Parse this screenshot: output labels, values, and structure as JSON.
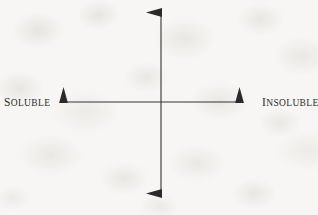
{
  "canvas": {
    "width": 318,
    "height": 215,
    "background_color": "#f7f6f4",
    "texture": "mottled-paper"
  },
  "diagram": {
    "type": "two-axis-cross",
    "line_color": "#333333",
    "line_width": 1.1,
    "center": {
      "x": 161,
      "y": 102
    },
    "axes": [
      {
        "id": "vertical-axis",
        "orientation": "vertical",
        "double_headed": true,
        "from": {
          "x": 161,
          "y": 194
        },
        "to": {
          "x": 161,
          "y": 12
        },
        "label_start": "",
        "label_end": ""
      },
      {
        "id": "horizontal-axis",
        "orientation": "horizontal",
        "double_headed": true,
        "from": {
          "x": 63,
          "y": 102
        },
        "to": {
          "x": 240,
          "y": 102
        },
        "label_start": "SOLUBLE",
        "label_end": "INSOLUBLE"
      }
    ],
    "arrowhead": {
      "length": 15,
      "half_width": 4.5,
      "color": "#2a2a2a"
    }
  },
  "labels": {
    "left": {
      "text": "SOLUBLE",
      "first_letter": "S",
      "rest": "OLUBLE",
      "x": 4,
      "y": 97,
      "color": "#2b2b2b",
      "style": "small-caps"
    },
    "right": {
      "text": "INSOLUBLE",
      "first_letter": "I",
      "rest": "NSOLUBLE",
      "x": 262,
      "y": 97,
      "color": "#2b2b2b",
      "style": "small-caps"
    }
  }
}
